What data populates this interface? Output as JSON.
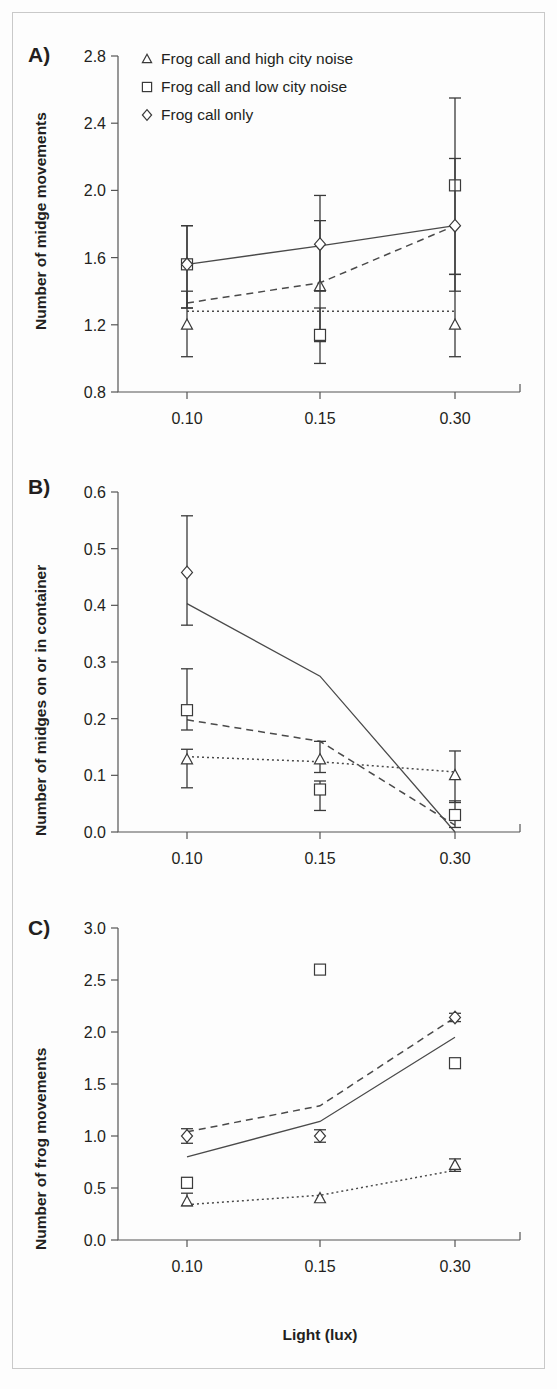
{
  "figure": {
    "xlabel": "Light (lux)",
    "panels": [
      "A)",
      "B)",
      "C)"
    ]
  },
  "legend": {
    "position": "top-left of panel A",
    "items": [
      {
        "marker": "triangle",
        "label": "Frog call and high city noise"
      },
      {
        "marker": "square",
        "label": "Frog call and low city noise"
      },
      {
        "marker": "diamond",
        "label": "Frog call only"
      }
    ]
  },
  "chart_data": [
    {
      "type": "line",
      "panel": "A)",
      "title": "",
      "xlabel": "",
      "ylabel": "Number of midge movements",
      "categories": [
        "0.10",
        "0.15",
        "0.30"
      ],
      "x": [
        0.1,
        0.15,
        0.3
      ],
      "ylim": [
        0.8,
        2.8
      ],
      "yticks": [
        "0.8",
        "1.2",
        "1.6",
        "2.0",
        "2.4",
        "2.8"
      ],
      "ytick_values": [
        0.8,
        1.2,
        1.6,
        2.0,
        2.4,
        2.8
      ],
      "grid": false,
      "series": [
        {
          "name": "Frog call and high city noise",
          "marker": "triangle",
          "line": "dotted",
          "values": [
            1.2,
            1.43,
            1.2
          ],
          "err_low": [
            1.01,
            1.1,
            1.01
          ],
          "err_high": [
            1.4,
            1.82,
            1.5
          ],
          "fit": [
            1.28,
            1.28,
            1.28
          ]
        },
        {
          "name": "Frog call and low city noise",
          "marker": "square",
          "line": "dashed",
          "values": [
            1.56,
            1.14,
            2.03
          ],
          "err_low": [
            1.3,
            0.97,
            1.4
          ],
          "err_high": [
            1.79,
            1.3,
            2.55
          ],
          "fit": [
            1.33,
            1.45,
            1.79
          ]
        },
        {
          "name": "Frog call only",
          "marker": "diamond",
          "line": "solid",
          "values": [
            1.56,
            1.68,
            1.79
          ],
          "err_low": [
            1.3,
            1.4,
            1.5
          ],
          "err_high": [
            1.79,
            1.97,
            2.19
          ],
          "fit": [
            1.56,
            1.67,
            1.79
          ]
        }
      ]
    },
    {
      "type": "line",
      "panel": "B)",
      "title": "",
      "xlabel": "",
      "ylabel": "Number of midges on  or in container",
      "categories": [
        "0.10",
        "0.15",
        "0.30"
      ],
      "x": [
        0.1,
        0.15,
        0.3
      ],
      "ylim": [
        0.0,
        0.6
      ],
      "yticks": [
        "0.0",
        "0.1",
        "0.2",
        "0.3",
        "0.4",
        "0.5",
        "0.6"
      ],
      "ytick_values": [
        0.0,
        0.1,
        0.2,
        0.3,
        0.4,
        0.5,
        0.6
      ],
      "grid": false,
      "series": [
        {
          "name": "Frog call and high city noise",
          "marker": "triangle",
          "line": "dotted",
          "values": [
            0.128,
            0.128,
            0.1
          ],
          "err_low": [
            0.078,
            0.105,
            0.052
          ],
          "err_high": [
            0.146,
            0.16,
            0.143
          ],
          "fit": [
            0.133,
            0.124,
            0.106
          ]
        },
        {
          "name": "Frog call and low city noise",
          "marker": "square",
          "line": "dashed",
          "values": [
            0.215,
            0.075,
            0.03
          ],
          "err_low": [
            0.18,
            0.038,
            0.008
          ],
          "err_high": [
            0.288,
            0.09,
            0.055
          ],
          "fit": [
            0.198,
            0.16,
            0.012
          ]
        },
        {
          "name": "Frog call only",
          "marker": "diamond",
          "line": "solid",
          "values": [
            0.458,
            null,
            null
          ],
          "err_low": [
            0.365,
            null,
            null
          ],
          "err_high": [
            0.558,
            null,
            null
          ],
          "fit": [
            0.403,
            0.275,
            0.0
          ]
        }
      ]
    },
    {
      "type": "line",
      "panel": "C)",
      "title": "",
      "xlabel": "Light (lux)",
      "ylabel": "Number of frog movements",
      "categories": [
        "0.10",
        "0.15",
        "0.30"
      ],
      "x": [
        0.1,
        0.15,
        0.3
      ],
      "ylim": [
        0.0,
        3.0
      ],
      "yticks": [
        "0.0",
        "0.5",
        "1.0",
        "1.5",
        "2.0",
        "2.5",
        "3.0"
      ],
      "ytick_values": [
        0.0,
        0.5,
        1.0,
        1.5,
        2.0,
        2.5,
        3.0
      ],
      "grid": false,
      "series": [
        {
          "name": "Frog call and high city noise",
          "marker": "triangle",
          "line": "dotted",
          "values": [
            0.37,
            0.4,
            0.72
          ],
          "err_low": [
            0.33,
            0.4,
            0.66
          ],
          "err_high": [
            0.45,
            0.4,
            0.78
          ],
          "fit": [
            0.34,
            0.43,
            0.67
          ]
        },
        {
          "name": "Frog call and low city noise",
          "marker": "square",
          "line": "solid",
          "values": [
            0.55,
            2.6,
            1.7
          ],
          "err_low": [
            0.5,
            2.6,
            1.7
          ],
          "err_high": [
            0.6,
            2.6,
            1.7
          ],
          "fit": [
            0.8,
            1.14,
            1.95
          ]
        },
        {
          "name": "Frog call only",
          "marker": "diamond",
          "line": "dashed",
          "values": [
            1.0,
            1.0,
            2.14
          ],
          "err_low": [
            0.93,
            0.94,
            2.1
          ],
          "err_high": [
            1.07,
            1.06,
            2.18
          ],
          "fit": [
            1.04,
            1.29,
            2.14
          ]
        }
      ]
    }
  ]
}
